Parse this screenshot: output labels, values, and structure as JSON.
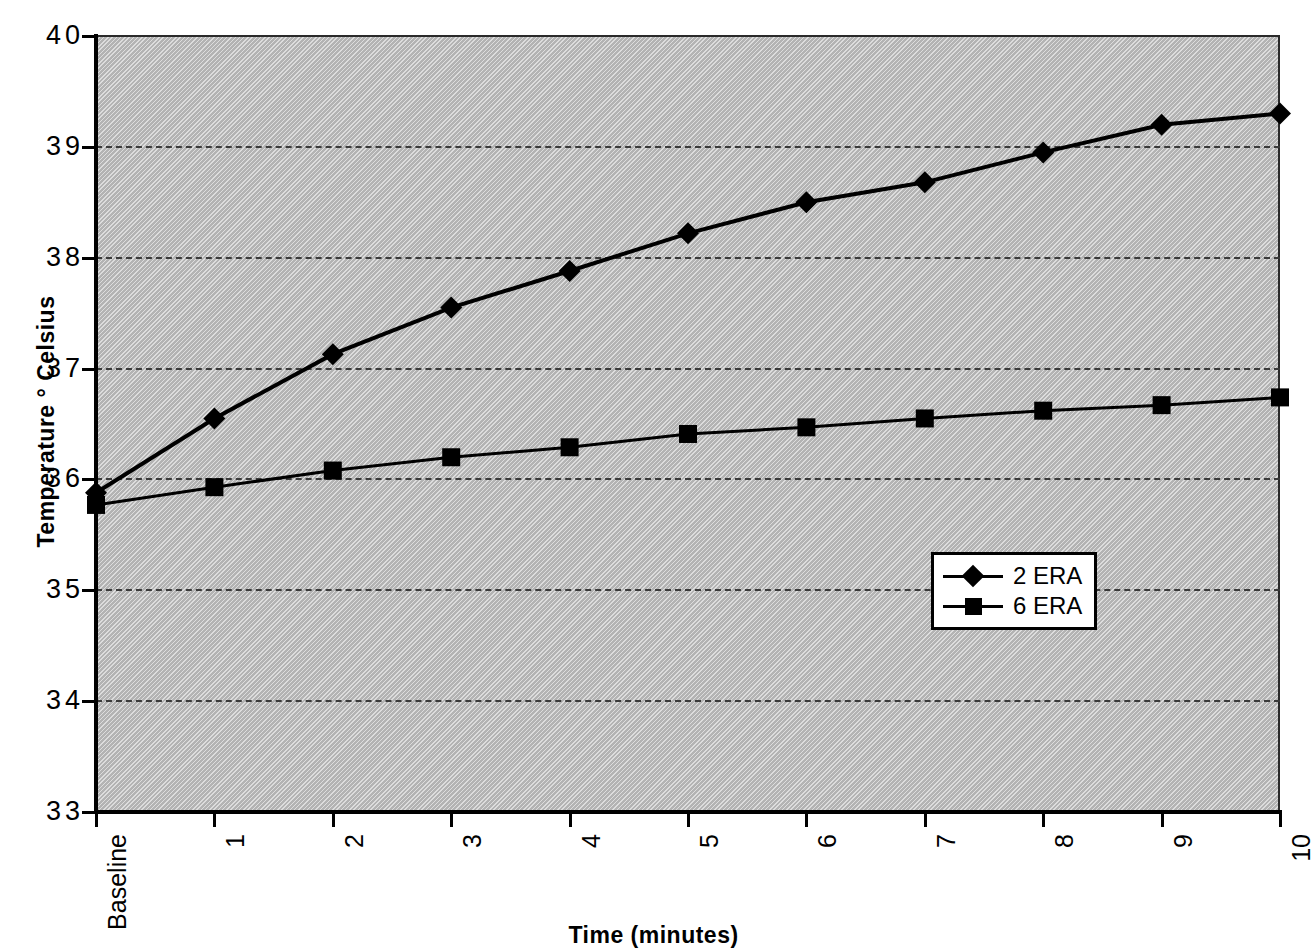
{
  "chart_data": {
    "type": "line",
    "title": "",
    "xlabel": "Time (minutes)",
    "ylabel": "Temperature ° Celsius",
    "categories": [
      "Baseline",
      "1",
      "2",
      "3",
      "4",
      "5",
      "6",
      "7",
      "8",
      "9",
      "10"
    ],
    "ylim": [
      33,
      40
    ],
    "yticks": [
      "33",
      "34",
      "35",
      "36",
      "37",
      "38",
      "39",
      "40"
    ],
    "ytick_values": [
      33,
      34,
      35,
      36,
      37,
      38,
      39,
      40
    ],
    "grid": "horizontal-dashed",
    "legend_position": "inside-right-lower",
    "plot_background": "#b3b3b3",
    "series_color": "#000000",
    "series": [
      {
        "name": "2 ERA",
        "marker": "diamond",
        "values": [
          35.88,
          36.55,
          37.13,
          37.55,
          37.88,
          38.22,
          38.5,
          38.68,
          38.95,
          39.2,
          39.3
        ]
      },
      {
        "name": "6 ERA",
        "marker": "square",
        "values": [
          35.77,
          35.93,
          36.08,
          36.2,
          36.29,
          36.41,
          36.47,
          36.55,
          36.62,
          36.67,
          36.74
        ]
      }
    ]
  },
  "axes": {
    "y_title": "Temperature ° Celsius",
    "x_title": "Time (minutes)"
  },
  "legend": {
    "items": [
      {
        "label": "2 ERA",
        "marker": "diamond"
      },
      {
        "label": "6 ERA",
        "marker": "square"
      }
    ]
  }
}
